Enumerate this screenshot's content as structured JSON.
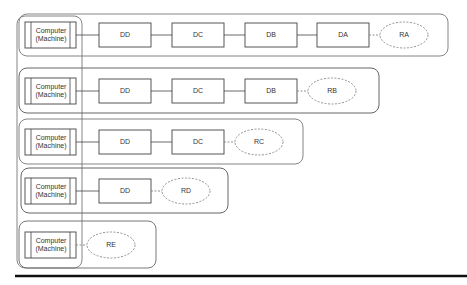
{
  "diagram": {
    "rows": [
      {
        "machine": [
          "Computer",
          "(Machine)"
        ],
        "nodes": [
          "DD",
          "DC",
          "DB",
          "DA"
        ],
        "result": "RA"
      },
      {
        "machine": [
          "Computer",
          "(Machine)"
        ],
        "nodes": [
          "DD",
          "DC",
          "DB"
        ],
        "result": "RB"
      },
      {
        "machine": [
          "Computer",
          "(Machine)"
        ],
        "nodes": [
          "DD",
          "DC"
        ],
        "result": "RC"
      },
      {
        "machine": [
          "Computer",
          "(Machine)"
        ],
        "nodes": [
          "DD"
        ],
        "result": "RD"
      },
      {
        "machine": [
          "Computer",
          "(Machine)"
        ],
        "nodes": [],
        "result": "RE"
      }
    ],
    "colors": {
      "stroke": "#555555",
      "dashed": "#777777",
      "text": "#333333"
    }
  }
}
